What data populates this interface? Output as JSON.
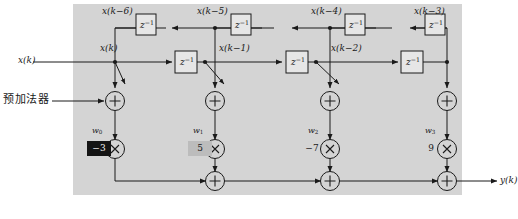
{
  "figure": {
    "type": "signal-flow-diagram",
    "background_color": "#ffffff",
    "panel_color": "#d4d4d4",
    "line_color": "#1a1a1a"
  },
  "annotations": {
    "pre_adder_label": "预加法器",
    "input_label": "x(k)",
    "output_label": "y(k)"
  },
  "signal_labels": {
    "input": "x(k)",
    "tap_top": "x(k)",
    "delay_1": "x(k−1)",
    "delay_2": "x(k−2)",
    "delay_3": "x(k−3)",
    "delay_4": "x(k−4)",
    "delay_5": "x(k−5)",
    "delay_6": "x(k−6)",
    "output": "y(k)"
  },
  "delay_blocks": [
    {
      "id": "z-top-1",
      "label": "z",
      "exponent": "−1"
    },
    {
      "id": "z-top-2",
      "label": "z",
      "exponent": "−1"
    },
    {
      "id": "z-top-3",
      "label": "z",
      "exponent": "−1"
    },
    {
      "id": "z-top-4",
      "label": "z",
      "exponent": "−1"
    },
    {
      "id": "z-mid-1",
      "label": "z",
      "exponent": "−1"
    },
    {
      "id": "z-mid-2",
      "label": "z",
      "exponent": "−1"
    },
    {
      "id": "z-mid-3",
      "label": "z",
      "exponent": "−1"
    }
  ],
  "weights": [
    {
      "name": "w",
      "index": "0",
      "value": "−3",
      "style": "boxed-dark"
    },
    {
      "name": "w",
      "index": "1",
      "value": "5",
      "style": "boxed-gray"
    },
    {
      "name": "w",
      "index": "2",
      "value": "−7",
      "style": "plain"
    },
    {
      "name": "w",
      "index": "3",
      "value": "9",
      "style": "plain"
    }
  ],
  "operators": {
    "adder_symbol": "+",
    "multiplier_symbol": "×",
    "adder_count": 4,
    "multiplier_count": 4,
    "output_adder_count": 3
  }
}
